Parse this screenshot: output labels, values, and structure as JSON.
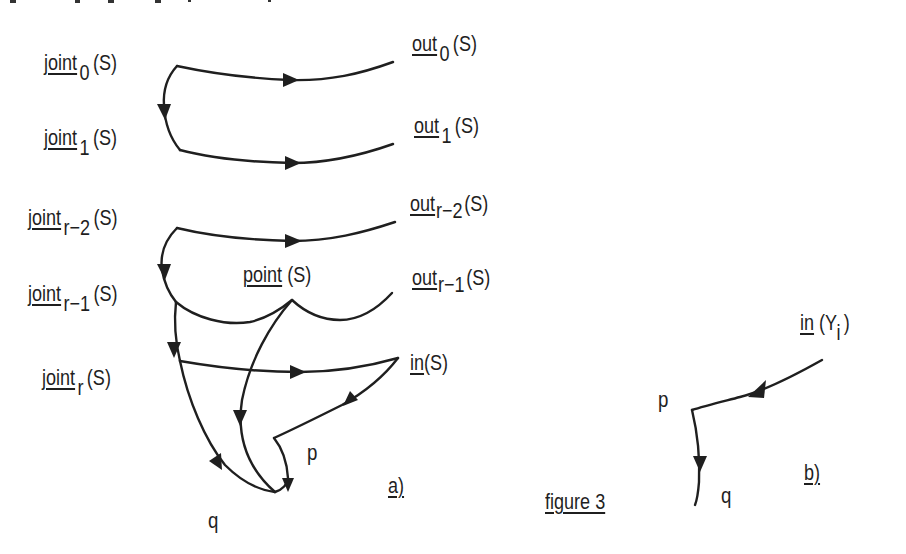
{
  "figure": {
    "caption": "figure 3",
    "panel_a_label": "a)",
    "panel_b_label": "b)"
  },
  "panel_a": {
    "left_labels": [
      {
        "name": "joint",
        "sub": "0",
        "arg": "(S)"
      },
      {
        "name": "joint",
        "sub": "1",
        "arg": "(S)"
      },
      {
        "name": "joint",
        "sub": "r−2",
        "arg": "(S)"
      },
      {
        "name": "joint",
        "sub": "r−1",
        "arg": "(S)"
      },
      {
        "name": "joint",
        "sub": "r",
        "arg": "(S)"
      }
    ],
    "right_labels": [
      {
        "name": "out",
        "sub": "0",
        "arg": "(S)"
      },
      {
        "name": "out",
        "sub": "1",
        "arg": "(S)"
      },
      {
        "name": "out",
        "sub": "r−2",
        "arg": "(S)"
      },
      {
        "name": "out",
        "sub": "r−1",
        "arg": "(S)"
      }
    ],
    "point_label": {
      "name": "point",
      "arg": "(S)"
    },
    "in_label": {
      "name": "in",
      "arg": "(S)"
    },
    "p": "p",
    "q": "q"
  },
  "panel_b": {
    "in_label": {
      "name": "in",
      "arg_open": "(Y",
      "sub": "i",
      "arg_close": ")"
    },
    "p": "p",
    "q": "q"
  },
  "colors": {
    "ink": "#1f1f1f",
    "background": "#ffffff"
  }
}
